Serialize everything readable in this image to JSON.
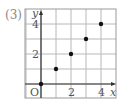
{
  "problem_label": "(3)",
  "chart_data": {
    "type": "scatter",
    "title": "",
    "xlabel": "x",
    "ylabel": "y",
    "origin_label": "O",
    "x_ticks": [
      2,
      4
    ],
    "y_ticks": [
      2,
      4
    ],
    "xlim": [
      -1,
      5
    ],
    "ylim": [
      -1,
      5
    ],
    "grid": true,
    "points": [
      {
        "x": 0,
        "y": 0
      },
      {
        "x": 1,
        "y": 1
      },
      {
        "x": 2,
        "y": 2
      },
      {
        "x": 3,
        "y": 3
      },
      {
        "x": 4,
        "y": 4
      }
    ]
  },
  "colors": {
    "grid": "#b8b8b8",
    "axis": "#333333",
    "point": "#111111",
    "text": "#555555"
  }
}
